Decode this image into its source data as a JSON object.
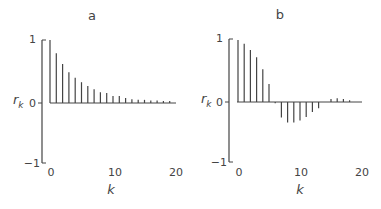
{
  "chart_data": [
    {
      "type": "bar",
      "title": "a",
      "xlabel": "k",
      "ylabel": "r_k",
      "ylim": [
        -1,
        1
      ],
      "xlim": [
        0,
        20
      ],
      "xticks": [
        "0",
        "10",
        "20"
      ],
      "yticks": [
        "-1",
        "0",
        "1"
      ],
      "grid": false,
      "legend": null,
      "x": [
        0,
        1,
        2,
        3,
        4,
        5,
        6,
        7,
        8,
        9,
        10,
        11,
        12,
        13,
        14,
        15,
        16,
        17,
        18,
        19
      ],
      "values": [
        1.0,
        0.79,
        0.62,
        0.49,
        0.4,
        0.33,
        0.27,
        0.22,
        0.17,
        0.16,
        0.11,
        0.11,
        0.08,
        0.06,
        0.05,
        0.05,
        0.04,
        0.04,
        0.03,
        0.03
      ]
    },
    {
      "type": "bar",
      "title": "b",
      "xlabel": "k",
      "ylabel": "r_k",
      "ylim": [
        -1,
        1
      ],
      "xlim": [
        0,
        20
      ],
      "xticks": [
        "0",
        "10",
        "20"
      ],
      "yticks": [
        "-1",
        "0",
        "1"
      ],
      "grid": false,
      "legend": null,
      "x": [
        0,
        1,
        2,
        3,
        4,
        5,
        6,
        7,
        8,
        9,
        10,
        11,
        12,
        13,
        14,
        15,
        16,
        17,
        18,
        19
      ],
      "values": [
        1.0,
        0.94,
        0.84,
        0.72,
        0.53,
        0.29,
        -0.02,
        -0.25,
        -0.33,
        -0.33,
        -0.3,
        -0.24,
        -0.16,
        -0.1,
        0.0,
        0.05,
        0.06,
        0.05,
        0.03,
        0.0
      ]
    }
  ],
  "panels": [
    {
      "title": "a",
      "ylabel_main": "r",
      "ylabel_sub": "k",
      "xlabel": "k",
      "ytick_top": "1",
      "ytick_mid": "0",
      "ytick_bot": "−1",
      "xtick_0": "0",
      "xtick_10": "10",
      "xtick_20": "20"
    },
    {
      "title": "b",
      "ylabel_main": "r",
      "ylabel_sub": "k",
      "xlabel": "k",
      "ytick_top": "1",
      "ytick_mid": "0",
      "ytick_bot": "−1",
      "xtick_0": "0",
      "xtick_10": "10",
      "xtick_20": "20"
    }
  ],
  "colors": {
    "ink": "#444444",
    "background": "#ffffff"
  }
}
